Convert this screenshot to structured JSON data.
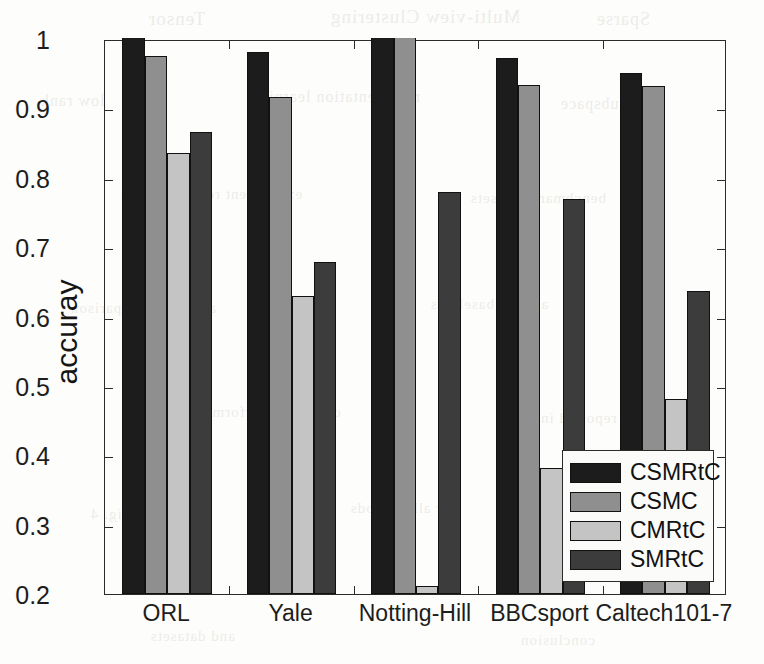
{
  "chart_data": {
    "type": "bar",
    "title": "",
    "subtitle": "",
    "xlabel": "",
    "ylabel": "accuray",
    "categories": [
      "ORL",
      "Yale",
      "Notting-Hill",
      "BBCsport",
      "Caltech101-7"
    ],
    "series": [
      {
        "name": "CSMRtC",
        "color": "#1c1c1c",
        "values": [
          1.0,
          0.981,
          1.0,
          0.973,
          0.951
        ]
      },
      {
        "name": "CSMC",
        "color": "#8f8f8f",
        "values": [
          0.975,
          0.917,
          1.0,
          0.934,
          0.932
        ]
      },
      {
        "name": "CMRtC",
        "color": "#c4c4c4",
        "values": [
          0.836,
          0.63,
          0.212,
          0.382,
          0.481
        ]
      },
      {
        "name": "SMRtC",
        "color": "#3c3c3c",
        "values": [
          0.866,
          0.678,
          0.779,
          0.77,
          0.637
        ]
      }
    ],
    "ylim": [
      0.2,
      1.0
    ],
    "yticks": [
      0.2,
      0.3,
      0.4,
      0.5,
      0.6,
      0.7,
      0.8,
      0.9,
      1.0
    ],
    "ytick_labels": [
      "0.2",
      "0.3",
      "0.4",
      "0.5",
      "0.6",
      "0.7",
      "0.8",
      "0.9",
      "1"
    ],
    "grid": false,
    "legend_position": "lower right",
    "legend_entries": [
      "CSMRtC",
      "CSMC",
      "CMRtC",
      "SMRtC"
    ],
    "axis_color": "#2b2b2b",
    "background_color": "#fdfdfb"
  },
  "background_ghost_text": [
    {
      "text": "Tensor",
      "x": 148,
      "y": 8,
      "size": 19
    },
    {
      "text": "Multi-view Clustering",
      "x": 330,
      "y": 6,
      "size": 19
    },
    {
      "text": "Sparse",
      "x": 596,
      "y": 9,
      "size": 18
    },
    {
      "text": "low rank",
      "x": 40,
      "y": 92,
      "size": 16
    },
    {
      "text": "representation learning",
      "x": 250,
      "y": 88,
      "size": 16
    },
    {
      "text": "subspace",
      "x": 560,
      "y": 95,
      "size": 16
    },
    {
      "text": "experiment results on five",
      "x": 120,
      "y": 186,
      "size": 15
    },
    {
      "text": "benchmark datasets",
      "x": 470,
      "y": 190,
      "size": 15
    },
    {
      "text": "accuracy comparison",
      "x": 70,
      "y": 300,
      "size": 15
    },
    {
      "text": "against baselines",
      "x": 430,
      "y": 296,
      "size": 15
    },
    {
      "text": "clustering performance",
      "x": 180,
      "y": 404,
      "size": 15
    },
    {
      "text": "is reported in",
      "x": 540,
      "y": 410,
      "size": 15
    },
    {
      "text": "Fig. 4",
      "x": 90,
      "y": 506,
      "size": 15
    },
    {
      "text": "for all methods",
      "x": 350,
      "y": 500,
      "size": 15
    },
    {
      "text": "and datasets",
      "x": 150,
      "y": 628,
      "size": 15
    },
    {
      "text": "conclusion",
      "x": 520,
      "y": 632,
      "size": 15
    }
  ]
}
